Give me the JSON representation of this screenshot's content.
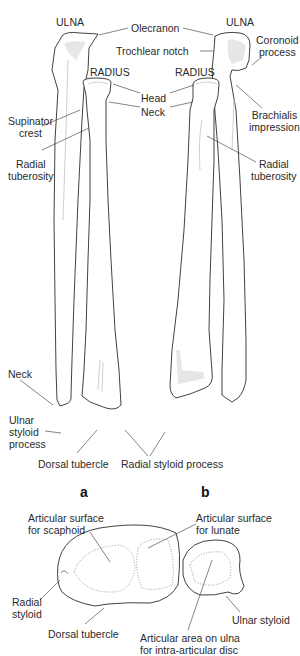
{
  "figure_a": {
    "caption": "a",
    "labels": {
      "ulna": "ULNA",
      "radius": "RADIUS",
      "supinator_crest_1": "Supinator",
      "supinator_crest_2": "crest",
      "radial_tuberosity_1": "Radial",
      "radial_tuberosity_2": "tuberosity",
      "neck": "Neck",
      "ulnar_styloid_1": "Ulnar",
      "ulnar_styloid_2": "styloid",
      "ulnar_styloid_3": "process",
      "dorsal_tubercle": "Dorsal tubercle"
    }
  },
  "figure_b": {
    "caption": "b",
    "labels": {
      "ulna": "ULNA",
      "radius": "RADIUS",
      "coronoid_1": "Coronoid",
      "coronoid_2": "process",
      "brachialis_1": "Brachialis",
      "brachialis_2": "impression",
      "radial_tuberosity_1": "Radial",
      "radial_tuberosity_2": "tuberosity"
    }
  },
  "shared_labels": {
    "olecranon": "Olecranon",
    "trochlear_notch": "Trochlear notch",
    "head": "Head",
    "neck": "Neck",
    "radial_styloid_process": "Radial styloid process"
  },
  "distal_view": {
    "labels": {
      "scaphoid_1": "Articular surface",
      "scaphoid_2": "for scaphoid",
      "lunate_1": "Articular surface",
      "lunate_2": "for lunate",
      "radial_styloid_1": "Radial",
      "radial_styloid_2": "styloid",
      "dorsal_tubercle": "Dorsal tubercle",
      "ulnar_styloid": "Ulnar styloid",
      "disc_1": "Articular area on ulna",
      "disc_2": "for intra-articular disc"
    }
  }
}
